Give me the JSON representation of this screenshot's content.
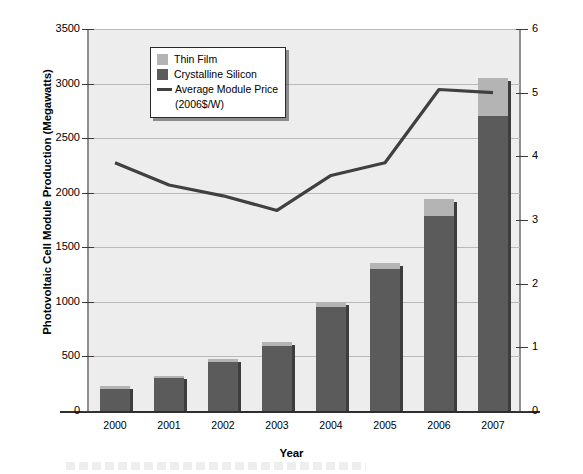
{
  "chart_data": {
    "type": "bar",
    "title": "",
    "xlabel": "Year",
    "ylabel": "Photovoltaic Cell Module Production (Megawatts)",
    "y2label": "Average Module Selling Price (2006 Dollars per Watt)",
    "categories": [
      "2000",
      "2001",
      "2002",
      "2003",
      "2004",
      "2005",
      "2006",
      "2007"
    ],
    "ylim": [
      0,
      3500
    ],
    "yticks": [
      0,
      500,
      1000,
      1500,
      2000,
      2500,
      3000,
      3500
    ],
    "y2lim": [
      0,
      6
    ],
    "y2ticks": [
      0,
      1,
      2,
      3,
      4,
      5,
      6
    ],
    "grid": true,
    "legend_position": "upper-left-inside",
    "stacked": true,
    "series": [
      {
        "name": "Crystalline Silicon",
        "type": "bar",
        "color": "#5b5b5b",
        "values": [
          205,
          300,
          450,
          595,
          955,
          1300,
          1790,
          2700
        ]
      },
      {
        "name": "Thin Film",
        "type": "bar",
        "color": "#b4b4b4",
        "values": [
          25,
          25,
          25,
          35,
          40,
          55,
          150,
          350
        ]
      },
      {
        "name": "Average Module Price (2006$/W)",
        "type": "line",
        "axis": "right",
        "color": "#404040",
        "values": [
          3.9,
          3.55,
          3.38,
          3.15,
          3.7,
          3.9,
          5.05,
          5.0
        ]
      }
    ],
    "totals": [
      230,
      325,
      475,
      630,
      995,
      1355,
      1940,
      3050
    ]
  },
  "legend": {
    "items": [
      {
        "label": "Thin Film",
        "swatch": "#b4b4b4",
        "kind": "swatch"
      },
      {
        "label": "Crystalline Silicon",
        "swatch": "#5b5b5b",
        "kind": "swatch"
      },
      {
        "label": "Average Module Price",
        "swatch": "#404040",
        "kind": "line"
      }
    ],
    "line_sublabel": "(2006$/W)"
  },
  "axes": {
    "left_title": "Photovoltaic Cell Module Production (Megawatts)",
    "right_title": "Average Module Selling Price (2006 Dollars per Watt)",
    "x_title": "Year",
    "left_ticks": [
      "3500",
      "3000",
      "2500",
      "2000",
      "1500",
      "1000",
      "500",
      "0"
    ],
    "right_ticks": [
      "6",
      "5",
      "4",
      "3",
      "2",
      "1",
      "0"
    ],
    "x_ticks": [
      "2000",
      "2001",
      "2002",
      "2003",
      "2004",
      "2005",
      "2006",
      "2007"
    ]
  },
  "colors": {
    "plot_background": "#ededed",
    "gridline": "#b9b9b9",
    "thin_film": "#b4b4b4",
    "crystalline_silicon": "#5b5b5b",
    "price_line": "#404040",
    "page_background": "#ffffff"
  }
}
